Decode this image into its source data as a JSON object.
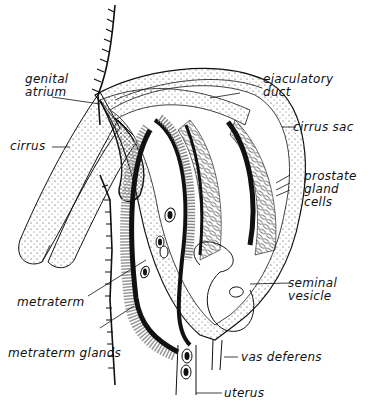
{
  "figure": {
    "labels": {
      "genital_atrium": [
        "genital",
        "atrium"
      ],
      "cirrus": "cirrus",
      "ejaculatory_duct": [
        "ejaculatory",
        "duct"
      ],
      "cirrus_sac": "cirrus sac",
      "prostate_gland_cells": [
        "prostate",
        "gland",
        "cells"
      ],
      "seminal_vesicle": [
        "seminal",
        "vesicle"
      ],
      "metraterm": "metraterm",
      "metraterm_glands": "metraterm glands",
      "vas_deferens": "vas deferens",
      "uterus": "uterus"
    },
    "colors": {
      "ink": "#111111",
      "paper": "#ffffff"
    }
  }
}
